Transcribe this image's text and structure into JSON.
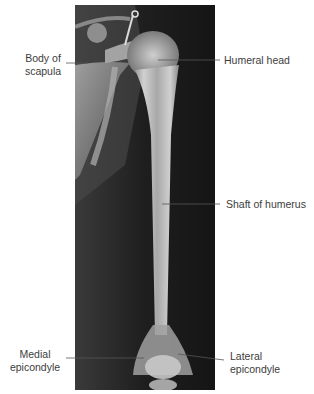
{
  "figure": {
    "type": "annotated radiograph",
    "subject": "humerus",
    "labels": [
      {
        "id": "body-of-scapula",
        "text_line1": "Body of",
        "text_line2": "scapula",
        "side": "left"
      },
      {
        "id": "humeral-head",
        "text_line1": "Humeral head",
        "text_line2": "",
        "side": "right"
      },
      {
        "id": "shaft-of-humerus",
        "text_line1": "Shaft of humerus",
        "text_line2": "",
        "side": "right"
      },
      {
        "id": "medial-epicondyle",
        "text_line1": "Medial",
        "text_line2": "epicondyle",
        "side": "left"
      },
      {
        "id": "lateral-epicondyle",
        "text_line1": "Lateral",
        "text_line2": "epicondyle",
        "side": "right"
      }
    ],
    "colors": {
      "background": "#ffffff",
      "film": "#1a1a1a",
      "bone": "#c8c8c8",
      "leader_line": "#555555",
      "text": "#3c3c3c"
    }
  }
}
